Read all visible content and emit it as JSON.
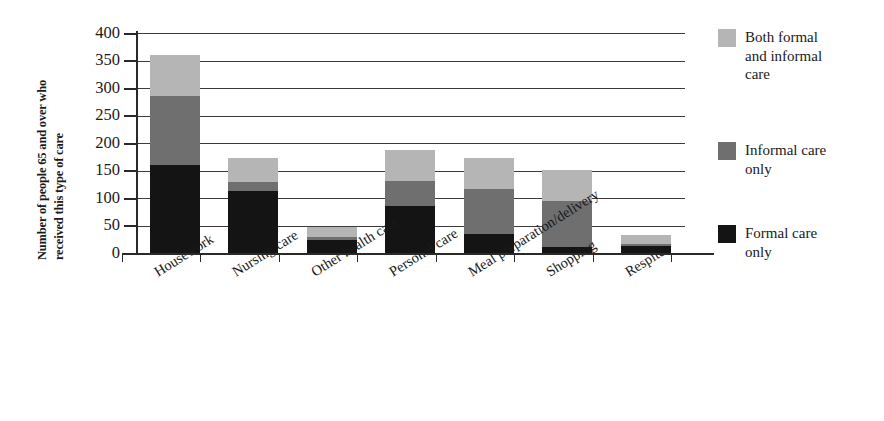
{
  "chart_data": {
    "type": "bar",
    "subtype": "stacked-bar",
    "title": "",
    "xlabel": "",
    "ylabel": "Number of people 65 and over who received this type of care",
    "ylabel_lines": [
      "Number of people 65 and over who",
      "received this type of care"
    ],
    "ylim": [
      0,
      400
    ],
    "ytick_step": 50,
    "yticks": [
      400,
      350,
      300,
      250,
      200,
      150,
      100,
      50,
      0
    ],
    "ytick_labels": [
      "400",
      "350",
      "300",
      "250",
      "200",
      "150",
      "100",
      "50",
      "0"
    ],
    "grid": true,
    "grid_axis": "y",
    "legend_position": "right",
    "categories": [
      "Housework",
      "Nursing care",
      "Other health care",
      "Personal care",
      "Meal preparation/delivery",
      "Shopping",
      "Respite"
    ],
    "series": [
      {
        "name": "Formal care only",
        "color": "#141414",
        "values": [
          160,
          113,
          23,
          85,
          35,
          11,
          12
        ]
      },
      {
        "name": "Informal care only",
        "color": "#6f6f6f",
        "values": [
          125,
          17,
          6,
          46,
          82,
          84,
          5
        ]
      },
      {
        "name": "Both formal and informal care",
        "color": "#b5b5b5",
        "values": [
          75,
          42,
          19,
          57,
          55,
          56,
          16
        ]
      }
    ],
    "totals": [
      360,
      172,
      48,
      188,
      172,
      151,
      33
    ]
  },
  "legend": {
    "entries": [
      {
        "label": "Both formal\nand informal\ncare",
        "color": "#b5b5b5",
        "swatch_name": "legend-swatch-both"
      },
      {
        "label": "Informal care\nonly",
        "color": "#6f6f6f",
        "swatch_name": "legend-swatch-informal"
      },
      {
        "label": "Formal care\nonly",
        "color": "#141414",
        "swatch_name": "legend-swatch-formal"
      }
    ]
  },
  "colors": {
    "formal_care_only": "#141414",
    "informal_care_only": "#6f6f6f",
    "both_formal_and_informal": "#b5b5b5",
    "axis": "#2a2a2a",
    "gridline": "#3a3a3a",
    "background": "#ffffff",
    "text": "#1a1a1a"
  }
}
